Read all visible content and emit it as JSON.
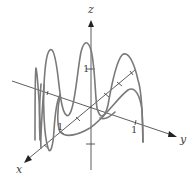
{
  "diagram": {
    "type": "3d-space-curve",
    "axes": {
      "x_label": "x",
      "y_label": "y",
      "z_label": "z"
    },
    "ticks": {
      "z_tick": "1",
      "x_tick": "1",
      "y_tick": "1"
    },
    "colors": {
      "curve": "#7a7a7a",
      "axes": "#333333",
      "background": "#ffffff"
    }
  }
}
